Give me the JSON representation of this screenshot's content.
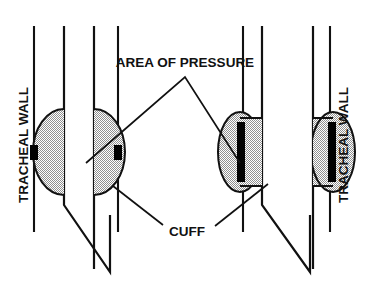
{
  "figure": {
    "width": 366,
    "height": 289,
    "background_color": "#ffffff",
    "line_color": "#111111",
    "cuff_fill_color": "#b9b9b9",
    "contact_color": "#000000"
  },
  "labels": {
    "tracheal_wall_left": "TRACHEAL WALL",
    "tracheal_wall_right": "TRACHEAL WALL",
    "area_of_pressure": "AREA OF PRESSURE",
    "cuff": "CUFF"
  },
  "annotations": [
    {
      "name": "tracheal-wall-left",
      "text": "TRACHEAL WALL",
      "orientation": "vertical-bottom-to-top",
      "x": 30,
      "y": 145
    },
    {
      "name": "tracheal-wall-right",
      "text": "TRACHEAL WALL",
      "orientation": "vertical-bottom-to-top",
      "x": 344,
      "y": 145
    },
    {
      "name": "area-of-pressure",
      "text": "AREA OF PRESSURE",
      "orientation": "horizontal",
      "x": 185,
      "y": 62,
      "leader_apex": [
        185,
        76
      ],
      "leader_targets": [
        [
          84,
          160
        ],
        [
          240,
          160
        ]
      ]
    },
    {
      "name": "cuff",
      "text": "CUFF",
      "orientation": "horizontal",
      "x": 186,
      "y": 232,
      "leader_targets": [
        [
          110,
          188
        ],
        [
          268,
          185
        ]
      ]
    }
  ],
  "figures": [
    {
      "name": "high-pressure-low-volume-cuff",
      "side": "left",
      "cuff_shape": "round-lens",
      "contact_area": "narrow-point",
      "trachea_wall_x": [
        34,
        118
      ],
      "tube_wall_x": [
        64,
        94
      ],
      "cuff_vertical_extent": [
        110,
        195
      ],
      "tube_tip_y": 272
    },
    {
      "name": "low-pressure-high-volume-cuff",
      "side": "right",
      "cuff_shape": "flat-barrel",
      "contact_area": "wide-bar",
      "trachea_wall_x": [
        243,
        330
      ],
      "tube_wall_x": [
        262,
        313
      ],
      "cuff_vertical_extent": [
        112,
        192
      ],
      "tube_tip_y": 272
    }
  ]
}
